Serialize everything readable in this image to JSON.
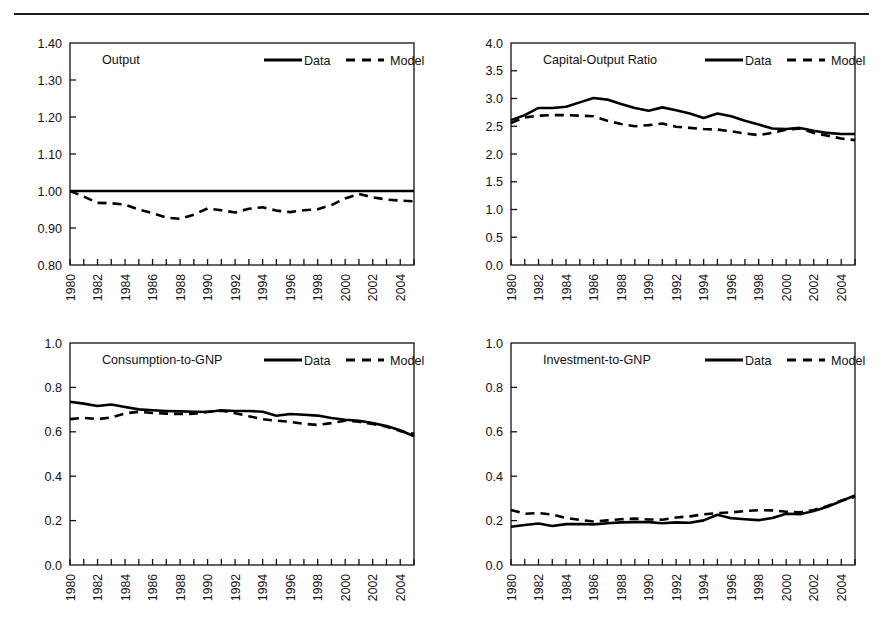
{
  "figure": {
    "top_rule": true,
    "layout": "2x2 grid of time-series line panels",
    "legend_labels": [
      "Data",
      "Model"
    ],
    "series_styles": {
      "Data": "solid",
      "Model": "dashed"
    },
    "line_color": "#000000"
  },
  "chart_data": [
    {
      "type": "line",
      "title": "Output",
      "xlabel": "",
      "ylabel": "",
      "grid": false,
      "legend": [
        "Data",
        "Model"
      ],
      "legend_position": "top-right inside axes",
      "xlim": [
        1980,
        2005
      ],
      "ylim": [
        0.8,
        1.4
      ],
      "yticks": [
        "0.80",
        "0.90",
        "1.00",
        "1.10",
        "1.20",
        "1.30",
        "1.40"
      ],
      "x": [
        1980,
        1981,
        1982,
        1983,
        1984,
        1985,
        1986,
        1987,
        1988,
        1989,
        1990,
        1991,
        1992,
        1993,
        1994,
        1995,
        1996,
        1997,
        1998,
        1999,
        2000,
        2001,
        2002,
        2003,
        2004,
        2005
      ],
      "xtick_labels": [
        "1980",
        "",
        "1982",
        "",
        "1984",
        "",
        "1986",
        "",
        "1988",
        "",
        "1990",
        "",
        "1992",
        "",
        "1994",
        "",
        "1996",
        "",
        "1998",
        "",
        "2000",
        "",
        "2002",
        "",
        "2004",
        ""
      ],
      "series": [
        {
          "name": "Data",
          "style": "solid",
          "values": [
            1.0,
            1.0,
            1.0,
            1.0,
            1.0,
            1.0,
            1.0,
            1.0,
            1.0,
            1.0,
            1.0,
            1.0,
            1.0,
            1.0,
            1.0,
            1.0,
            1.0,
            1.0,
            1.0,
            1.0,
            1.0,
            1.0,
            1.0,
            1.0,
            1.0,
            1.0
          ]
        },
        {
          "name": "Model",
          "style": "dashed",
          "values": [
            1.0,
            0.985,
            0.968,
            0.967,
            0.963,
            0.95,
            0.94,
            0.928,
            0.925,
            0.936,
            0.953,
            0.948,
            0.942,
            0.952,
            0.956,
            0.947,
            0.943,
            0.948,
            0.951,
            0.962,
            0.98,
            0.992,
            0.983,
            0.977,
            0.974,
            0.972
          ]
        }
      ]
    },
    {
      "type": "line",
      "title": "Capital-Output Ratio",
      "xlabel": "",
      "ylabel": "",
      "grid": false,
      "legend": [
        "Data",
        "Model"
      ],
      "legend_position": "top-right inside axes",
      "xlim": [
        1980,
        2005
      ],
      "ylim": [
        0.0,
        4.0
      ],
      "yticks": [
        "0.0",
        "0.5",
        "1.0",
        "1.5",
        "2.0",
        "2.5",
        "3.0",
        "3.5",
        "4.0"
      ],
      "x": [
        1980,
        1981,
        1982,
        1983,
        1984,
        1985,
        1986,
        1987,
        1988,
        1989,
        1990,
        1991,
        1992,
        1993,
        1994,
        1995,
        1996,
        1997,
        1998,
        1999,
        2000,
        2001,
        2002,
        2003,
        2004,
        2005
      ],
      "xtick_labels": [
        "1980",
        "",
        "1982",
        "",
        "1984",
        "",
        "1986",
        "",
        "1988",
        "",
        "1990",
        "",
        "1992",
        "",
        "1994",
        "",
        "1996",
        "",
        "1998",
        "",
        "2000",
        "",
        "2002",
        "",
        "2004",
        ""
      ],
      "series": [
        {
          "name": "Data",
          "style": "solid",
          "values": [
            2.61,
            2.7,
            2.83,
            2.83,
            2.85,
            2.93,
            3.01,
            2.98,
            2.9,
            2.83,
            2.78,
            2.84,
            2.79,
            2.73,
            2.65,
            2.73,
            2.68,
            2.6,
            2.53,
            2.46,
            2.45,
            2.47,
            2.42,
            2.38,
            2.36,
            2.36
          ]
        },
        {
          "name": "Model",
          "style": "dashed",
          "values": [
            2.56,
            2.66,
            2.69,
            2.7,
            2.7,
            2.69,
            2.68,
            2.6,
            2.54,
            2.5,
            2.52,
            2.55,
            2.49,
            2.47,
            2.45,
            2.44,
            2.41,
            2.37,
            2.34,
            2.38,
            2.44,
            2.46,
            2.38,
            2.33,
            2.28,
            2.25
          ]
        }
      ]
    },
    {
      "type": "line",
      "title": "Consumption-to-GNP",
      "xlabel": "",
      "ylabel": "",
      "grid": false,
      "legend": [
        "Data",
        "Model"
      ],
      "legend_position": "top-right inside axes",
      "xlim": [
        1980,
        2005
      ],
      "ylim": [
        0.0,
        1.0
      ],
      "yticks": [
        "0.0",
        "0.2",
        "0.4",
        "0.6",
        "0.8",
        "1.0"
      ],
      "x": [
        1980,
        1981,
        1982,
        1983,
        1984,
        1985,
        1986,
        1987,
        1988,
        1989,
        1990,
        1991,
        1992,
        1993,
        1994,
        1995,
        1996,
        1997,
        1998,
        1999,
        2000,
        2001,
        2002,
        2003,
        2004,
        2005
      ],
      "xtick_labels": [
        "1980",
        "",
        "1982",
        "",
        "1984",
        "",
        "1986",
        "",
        "1988",
        "",
        "1990",
        "",
        "1992",
        "",
        "1994",
        "",
        "1996",
        "",
        "1998",
        "",
        "2000",
        "",
        "2002",
        "",
        "2004",
        ""
      ],
      "series": [
        {
          "name": "Data",
          "style": "solid",
          "values": [
            0.735,
            0.727,
            0.716,
            0.723,
            0.712,
            0.701,
            0.697,
            0.694,
            0.692,
            0.69,
            0.689,
            0.697,
            0.694,
            0.694,
            0.69,
            0.672,
            0.68,
            0.677,
            0.673,
            0.662,
            0.654,
            0.65,
            0.639,
            0.626,
            0.607,
            0.58
          ]
        },
        {
          "name": "Model",
          "style": "dashed",
          "values": [
            0.657,
            0.663,
            0.657,
            0.665,
            0.683,
            0.69,
            0.685,
            0.682,
            0.68,
            0.681,
            0.69,
            0.695,
            0.684,
            0.67,
            0.657,
            0.65,
            0.645,
            0.636,
            0.631,
            0.639,
            0.65,
            0.645,
            0.635,
            0.623,
            0.603,
            0.591
          ]
        }
      ]
    },
    {
      "type": "line",
      "title": "Investment-to-GNP",
      "xlabel": "",
      "ylabel": "",
      "grid": false,
      "legend": [
        "Data",
        "Model"
      ],
      "legend_position": "top-right inside axes",
      "xlim": [
        1980,
        2005
      ],
      "ylim": [
        0.0,
        1.0
      ],
      "yticks": [
        "0.0",
        "0.2",
        "0.4",
        "0.6",
        "0.8",
        "1.0"
      ],
      "x": [
        1980,
        1981,
        1982,
        1983,
        1984,
        1985,
        1986,
        1987,
        1988,
        1989,
        1990,
        1991,
        1992,
        1993,
        1994,
        1995,
        1996,
        1997,
        1998,
        1999,
        2000,
        2001,
        2002,
        2003,
        2004,
        2005
      ],
      "xtick_labels": [
        "1980",
        "",
        "1982",
        "",
        "1984",
        "",
        "1986",
        "",
        "1988",
        "",
        "1990",
        "",
        "1992",
        "",
        "1994",
        "",
        "1996",
        "",
        "1998",
        "",
        "2000",
        "",
        "2002",
        "",
        "2004",
        ""
      ],
      "series": [
        {
          "name": "Data",
          "style": "solid",
          "values": [
            0.172,
            0.18,
            0.187,
            0.176,
            0.184,
            0.185,
            0.183,
            0.188,
            0.192,
            0.193,
            0.193,
            0.188,
            0.192,
            0.19,
            0.201,
            0.226,
            0.211,
            0.206,
            0.202,
            0.212,
            0.231,
            0.229,
            0.243,
            0.262,
            0.288,
            0.313
          ]
        },
        {
          "name": "Model",
          "style": "dashed",
          "values": [
            0.248,
            0.231,
            0.234,
            0.227,
            0.212,
            0.203,
            0.196,
            0.201,
            0.206,
            0.209,
            0.205,
            0.204,
            0.214,
            0.219,
            0.228,
            0.234,
            0.237,
            0.243,
            0.247,
            0.246,
            0.24,
            0.237,
            0.248,
            0.266,
            0.29,
            0.307
          ]
        }
      ]
    }
  ]
}
